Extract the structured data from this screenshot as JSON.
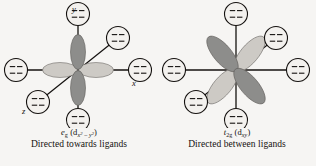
{
  "figure": {
    "background_color": "#f6f5f3",
    "ink_color": "#14110f",
    "lobe_dark_color": "#8d8d8b",
    "lobe_light_color": "#cdcac5",
    "ligand_fill_color": "#f3f1ee"
  },
  "panels": [
    {
      "id": "eg-panel",
      "orbital_label": {
        "symbol": "e",
        "symbol_sub": "g",
        "orbital": "d",
        "orbital_sub": "x2 – y2",
        "full_text": "eg (dx2 – y2)"
      },
      "description": "Directed towards ligands",
      "axes": [
        {
          "name": "y",
          "label": "y"
        },
        {
          "name": "x",
          "label": "x"
        },
        {
          "name": "z",
          "label": "z"
        }
      ],
      "ligand_count": 6,
      "ligands": [
        {
          "position": "top"
        },
        {
          "position": "bottom"
        },
        {
          "position": "left"
        },
        {
          "position": "right"
        },
        {
          "position": "upper-right"
        },
        {
          "position": "lower-left"
        }
      ],
      "lobes": [
        {
          "direction": "up",
          "shade": "dark"
        },
        {
          "direction": "down",
          "shade": "dark"
        },
        {
          "direction": "left",
          "shade": "light"
        },
        {
          "direction": "right",
          "shade": "light"
        }
      ]
    },
    {
      "id": "t2g-panel",
      "orbital_label": {
        "symbol": "t",
        "symbol_sub": "2g",
        "orbital": "d",
        "orbital_sub": "xy",
        "full_text": "t2g (dxy)"
      },
      "description": "Directed between ligands",
      "axes": [],
      "ligand_count": 6,
      "ligands": [
        {
          "position": "top"
        },
        {
          "position": "bottom"
        },
        {
          "position": "left"
        },
        {
          "position": "right"
        },
        {
          "position": "upper-right"
        },
        {
          "position": "lower-left"
        }
      ],
      "lobes": [
        {
          "direction": "upper-left",
          "shade": "light"
        },
        {
          "direction": "lower-right",
          "shade": "light"
        },
        {
          "direction": "upper-right",
          "shade": "dark"
        },
        {
          "direction": "lower-left",
          "shade": "dark"
        }
      ]
    }
  ]
}
